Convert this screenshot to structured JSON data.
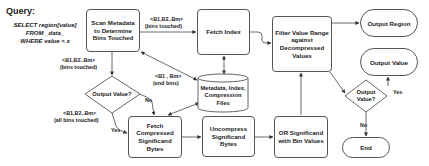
{
  "query": {
    "title": "Query:",
    "lines": [
      "SELECT region[value]",
      "FROM _data_",
      "WHERE value < x"
    ]
  },
  "nodes": {
    "scan": "Scan Metadata to Determine Bins Touched",
    "fetch_index": "Fetch Index",
    "filter": "Filter Value Range against Decompressed Values",
    "output_region": "Output Region",
    "output_value": "Output Value",
    "metadata_store": "Metadata, Index, Compression Files",
    "decision1": "Output Value?",
    "fetch_compressed": "Fetch Compressed Significand Bytes",
    "uncompress": "Uncompress Significand Bytes",
    "or_bins": "OR Significand with Bin Values",
    "decision2": "Output Value?",
    "end": "End"
  },
  "edge_labels": {
    "scan_to_fetch_a": "<B1,B2..Bm>",
    "scan_to_fetch_b": "(bins touched)",
    "scan_to_dec_a": "<B1,B2..Bm>",
    "scan_to_dec_b": "(bins touched)",
    "end_bins_a": "<B1 , Bm>",
    "end_bins_b": "(end bins)",
    "all_bins_a": "<B1,B2..Bm>",
    "all_bins_b": "(all bins touched)",
    "dec1_no": "No",
    "dec1_yes": "Yes",
    "dec2_yes": "Yes",
    "dec2_no": "No"
  }
}
